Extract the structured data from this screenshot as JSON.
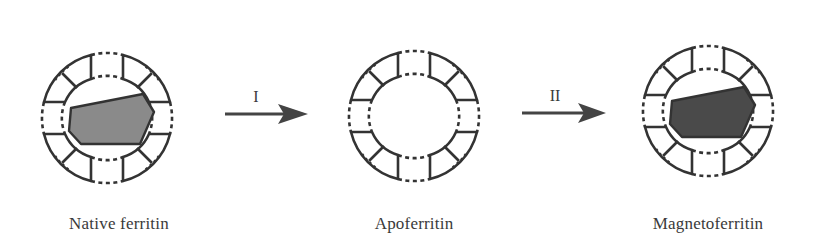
{
  "figure": {
    "panels": [
      {
        "id": "native",
        "caption": "Native ferritin",
        "core": true,
        "core_color": "#8a8a8a"
      },
      {
        "id": "apo",
        "caption": "Apoferritin",
        "core": false
      },
      {
        "id": "magneto",
        "caption": "Magnetoferritin",
        "core": true,
        "core_color": "#4a4a4a"
      }
    ],
    "arrows": [
      {
        "label": "I"
      },
      {
        "label": "II"
      }
    ],
    "colors": {
      "stroke": "#333333",
      "native_core": "#8a8a8a",
      "magneto_core": "#4a4a4a"
    }
  }
}
